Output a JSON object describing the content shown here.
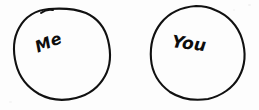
{
  "canvas": {
    "width": 259,
    "height": 110,
    "background_color": "#fdfdfd",
    "ink_color": "#111111",
    "description": "Hand-drawn sketch of two separate circles, each containing a handwritten word"
  },
  "shapes": [
    {
      "id": "circle-me",
      "kind": "hand-drawn-circle",
      "label": "Me",
      "center_x": 62,
      "center_y": 54,
      "radius_x": 48,
      "radius_y": 46,
      "has_overshoot_notch": true
    },
    {
      "id": "circle-you",
      "kind": "hand-drawn-circle",
      "label": "You",
      "center_x": 197,
      "center_y": 53,
      "radius_x": 47,
      "radius_y": 47,
      "has_overshoot_notch": false
    }
  ],
  "labels": {
    "me": {
      "text": "Me",
      "rotation_degrees": -22,
      "x": 36,
      "y": 40
    },
    "you": {
      "text": "You",
      "rotation_degrees": 7,
      "x": 172,
      "y": 33
    }
  }
}
